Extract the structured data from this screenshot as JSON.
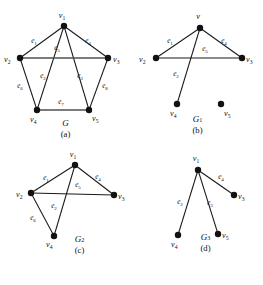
{
  "figure": {
    "panels": [
      {
        "id": "panel-a",
        "graph_name": "G",
        "graph_sub": "",
        "caption_letter": "(a)",
        "vertices": [
          {
            "id": "v1",
            "label": "v",
            "sub": "1",
            "x": 64,
            "y": 20,
            "lx": 62,
            "ly": 12,
            "anchor": "middle"
          },
          {
            "id": "v2",
            "label": "v",
            "sub": "2",
            "x": 20,
            "y": 52,
            "lx": 4,
            "ly": 56,
            "anchor": "start"
          },
          {
            "id": "v3",
            "label": "v",
            "sub": "3",
            "x": 108,
            "y": 52,
            "lx": 113,
            "ly": 56,
            "anchor": "start"
          },
          {
            "id": "v4",
            "label": "v",
            "sub": "4",
            "x": 37,
            "y": 104,
            "lx": 30,
            "ly": 116,
            "anchor": "start"
          },
          {
            "id": "v5",
            "label": "v",
            "sub": "5",
            "x": 89,
            "y": 104,
            "lx": 92,
            "ly": 115,
            "anchor": "start"
          }
        ],
        "edges": [
          {
            "id": "e1",
            "from": "v1",
            "to": "v2",
            "label": "e",
            "sub": "1",
            "lx": 34,
            "ly": 37,
            "thick": false
          },
          {
            "id": "e2",
            "from": "v1",
            "to": "v4",
            "label": "e",
            "sub": "2",
            "lx": 43,
            "ly": 72,
            "thick": false
          },
          {
            "id": "e3",
            "from": "v1",
            "to": "v5",
            "label": "e",
            "sub": "3",
            "lx": 80,
            "ly": 72,
            "thick": false
          },
          {
            "id": "e4",
            "from": "v1",
            "to": "v3",
            "label": "e",
            "sub": "4",
            "lx": 88,
            "ly": 37,
            "thick": false
          },
          {
            "id": "e5",
            "from": "v2",
            "to": "v3",
            "label": "e",
            "sub": "5",
            "lx": 57,
            "ly": 44,
            "thick": true
          },
          {
            "id": "e6",
            "from": "v2",
            "to": "v4",
            "label": "e",
            "sub": "6",
            "lx": 20,
            "ly": 82,
            "thick": false
          },
          {
            "id": "e7",
            "from": "v4",
            "to": "v5",
            "label": "e",
            "sub": "7",
            "lx": 61,
            "ly": 98,
            "thick": true
          },
          {
            "id": "e8",
            "from": "v3",
            "to": "v5",
            "label": "e",
            "sub": "8",
            "lx": 105,
            "ly": 82,
            "thick": false
          }
        ]
      },
      {
        "id": "panel-b",
        "graph_name": "G",
        "graph_sub": "1",
        "caption_letter": "(b)",
        "vertices": [
          {
            "id": "v1",
            "label": "v",
            "sub": "",
            "x": 68,
            "y": 22,
            "lx": 66,
            "ly": 13,
            "anchor": "middle"
          },
          {
            "id": "v2",
            "label": "v",
            "sub": "2",
            "x": 24,
            "y": 52,
            "lx": 7,
            "ly": 56,
            "anchor": "start"
          },
          {
            "id": "v3",
            "label": "v",
            "sub": "3",
            "x": 110,
            "y": 52,
            "lx": 114,
            "ly": 56,
            "anchor": "start"
          },
          {
            "id": "v4",
            "label": "v",
            "sub": "4",
            "x": 45,
            "y": 98,
            "lx": 38,
            "ly": 110,
            "anchor": "start"
          },
          {
            "id": "v5",
            "label": "v",
            "sub": "5",
            "x": 89,
            "y": 98,
            "lx": 92,
            "ly": 110,
            "anchor": "start"
          }
        ],
        "edges": [
          {
            "id": "e1",
            "from": "v1",
            "to": "v2",
            "label": "e",
            "sub": "1",
            "lx": 38,
            "ly": 37,
            "thick": false
          },
          {
            "id": "e4",
            "from": "v1",
            "to": "v3",
            "label": "e",
            "sub": "4",
            "lx": 92,
            "ly": 37,
            "thick": false
          },
          {
            "id": "e5",
            "from": "v2",
            "to": "v3",
            "label": "e",
            "sub": "5",
            "lx": 73,
            "ly": 45,
            "thick": false
          },
          {
            "id": "e2",
            "from": "v1",
            "to": "v4",
            "label": "e",
            "sub": "2",
            "lx": 44,
            "ly": 70,
            "thick": false
          }
        ],
        "isolated": [
          "v5"
        ]
      },
      {
        "id": "panel-c",
        "graph_name": "G",
        "graph_sub": "2",
        "caption_letter": "(c)",
        "vertices": [
          {
            "id": "v1",
            "label": "v",
            "sub": "1",
            "x": 53,
            "y": 17,
            "lx": 51,
            "ly": 9,
            "anchor": "middle"
          },
          {
            "id": "v2",
            "label": "v",
            "sub": "2",
            "x": 9,
            "y": 45,
            "lx": -6,
            "ly": 49,
            "anchor": "start"
          },
          {
            "id": "v3",
            "label": "v",
            "sub": "3",
            "x": 92,
            "y": 47,
            "lx": 96,
            "ly": 51,
            "anchor": "start"
          },
          {
            "id": "v4",
            "label": "v",
            "sub": "4",
            "x": 32,
            "y": 88,
            "lx": 24,
            "ly": 99,
            "anchor": "start"
          }
        ],
        "edges": [
          {
            "id": "e1",
            "from": "v1",
            "to": "v2",
            "label": "e",
            "sub": "1",
            "lx": 24,
            "ly": 32,
            "thick": false
          },
          {
            "id": "e4",
            "from": "v1",
            "to": "v3",
            "label": "e",
            "sub": "4",
            "lx": 76,
            "ly": 31,
            "thick": false
          },
          {
            "id": "e5",
            "from": "v2",
            "to": "v3",
            "label": "e",
            "sub": "5",
            "lx": 56,
            "ly": 39,
            "thick": false
          },
          {
            "id": "e2",
            "from": "v1",
            "to": "v4",
            "label": "e",
            "sub": "2",
            "lx": 32,
            "ly": 60,
            "thick": false
          },
          {
            "id": "e6",
            "from": "v2",
            "to": "v4",
            "label": "e",
            "sub": "6",
            "lx": 11,
            "ly": 72,
            "thick": false
          }
        ]
      },
      {
        "id": "panel-d",
        "graph_name": "G",
        "graph_sub": "3",
        "caption_letter": "(d)",
        "vertices": [
          {
            "id": "v1",
            "label": "v",
            "sub": "1",
            "x": 50,
            "y": 22,
            "lx": 48,
            "ly": 13,
            "anchor": "middle"
          },
          {
            "id": "v3",
            "label": "v",
            "sub": "3",
            "x": 86,
            "y": 47,
            "lx": 90,
            "ly": 51,
            "anchor": "start"
          },
          {
            "id": "v4",
            "label": "v",
            "sub": "4",
            "x": 30,
            "y": 87,
            "lx": 23,
            "ly": 99,
            "anchor": "start"
          },
          {
            "id": "v5",
            "label": "v",
            "sub": "5",
            "x": 70,
            "y": 86,
            "lx": 74,
            "ly": 90,
            "anchor": "start"
          }
        ],
        "edges": [
          {
            "id": "e4",
            "from": "v1",
            "to": "v3",
            "label": "e",
            "sub": "4",
            "lx": 73,
            "ly": 31,
            "thick": false
          },
          {
            "id": "e2",
            "from": "v1",
            "to": "v4",
            "label": "e",
            "sub": "2",
            "lx": 32,
            "ly": 56,
            "thick": false
          },
          {
            "id": "e3",
            "from": "v1",
            "to": "v5",
            "label": "e",
            "sub": "3",
            "lx": 62,
            "ly": 57,
            "thick": false
          }
        ]
      }
    ]
  },
  "style": {
    "edge_color": "#1a1a1a",
    "edge_highlight_color": "#4f4f4f",
    "node_color": "#111111",
    "background": "#ffffff"
  }
}
